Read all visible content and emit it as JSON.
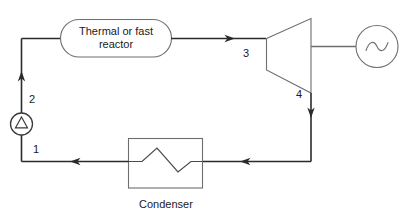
{
  "diagram": {
    "type": "process-flow",
    "title": "",
    "stroke_color": "#2b2b2b",
    "shape_stroke_color": "#6e6e6e",
    "background": "#ffffff",
    "nodes": [
      {
        "id": "reactor",
        "shape": "stadium",
        "label": "Thermal or fast reactor",
        "label_line_1": "Thermal or fast",
        "label_line_2": "reactor"
      },
      {
        "id": "turbine",
        "shape": "trapezoid",
        "label": ""
      },
      {
        "id": "generator",
        "shape": "circle-sine",
        "label": ""
      },
      {
        "id": "condenser",
        "shape": "rectangle-zigzag",
        "label": "Condenser"
      },
      {
        "id": "pump",
        "shape": "circle-triangle",
        "label": ""
      }
    ],
    "state_points": [
      {
        "id": "1",
        "label": "1"
      },
      {
        "id": "2",
        "label": "2"
      },
      {
        "id": "3",
        "label": "3"
      },
      {
        "id": "4",
        "label": "4"
      }
    ],
    "flows": [
      {
        "from": "pump",
        "to": "reactor",
        "state": "2",
        "direction": "up"
      },
      {
        "from": "reactor",
        "to": "turbine",
        "state": "3",
        "direction": "right"
      },
      {
        "from": "turbine",
        "to": "condenser",
        "state": "4",
        "direction": "down-left"
      },
      {
        "from": "condenser",
        "to": "pump",
        "state": "1",
        "direction": "left"
      },
      {
        "from": "turbine",
        "to": "generator",
        "state": "",
        "direction": "right"
      }
    ]
  }
}
